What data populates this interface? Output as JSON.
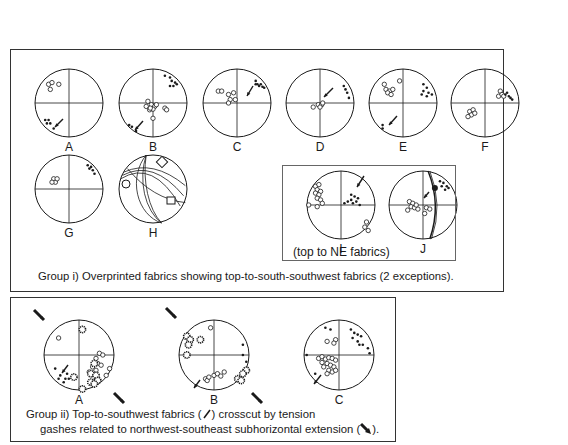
{
  "group1": {
    "caption": "Group i) Overprinted fabrics showing top-to-south-southwest fabrics (2 exceptions).",
    "subgroup_caption": "(top to NE fabrics)",
    "nets": [
      {
        "id": "A",
        "label": "A"
      },
      {
        "id": "B",
        "label": "B"
      },
      {
        "id": "C",
        "label": "C"
      },
      {
        "id": "D",
        "label": "D"
      },
      {
        "id": "E",
        "label": "E"
      },
      {
        "id": "F",
        "label": "F"
      },
      {
        "id": "G",
        "label": "G"
      },
      {
        "id": "H",
        "label": "H"
      },
      {
        "id": "I",
        "label": "I"
      },
      {
        "id": "J",
        "label": "J"
      }
    ]
  },
  "group2": {
    "caption_line1_pre": "Group ii) Top-to-southwest fabrics (",
    "caption_line1_post": ") crosscut by tension",
    "caption_line2_pre": "gashes related to northwest-southeast subhorizontal extension (",
    "caption_line2_post": ").",
    "nets": [
      {
        "id": "A",
        "label": "A"
      },
      {
        "id": "B",
        "label": "B"
      },
      {
        "id": "C",
        "label": "C"
      }
    ]
  },
  "colors": {
    "ink": "#1a1a1a",
    "frame": "#333333",
    "background": "#ffffff"
  }
}
